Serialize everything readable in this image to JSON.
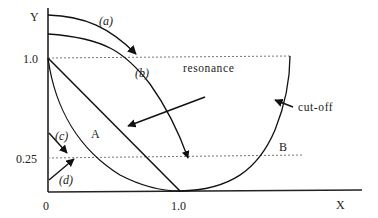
{
  "diagram": {
    "axes": {
      "y_label": "Y",
      "x_label": "X",
      "y_ticks": [
        "1.0",
        "0.25"
      ],
      "x_ticks": [
        "0",
        "1.0"
      ]
    },
    "curve_labels": {
      "a": "(a)",
      "b": "(b)",
      "c": "(c)",
      "d": "(d)"
    },
    "regions": {
      "A": "A",
      "B": "B"
    },
    "annotations": {
      "resonance": "resonance",
      "cutoff": "cut-off"
    },
    "reference_lines": [
      {
        "level": "1.0",
        "style": "dotted"
      },
      {
        "level": "0.25",
        "style": "dotted"
      }
    ],
    "colors": {
      "line": "#222222",
      "dotted": "#777777"
    }
  }
}
